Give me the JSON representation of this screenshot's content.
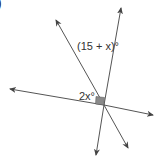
{
  "figure": {
    "corner_glyph": ")",
    "labels": {
      "top_angle": "(15 + x)°",
      "left_angle": "2x°"
    },
    "lines": [
      {
        "name": "line-steep",
        "from": [
          96,
          155
        ],
        "to": [
          121,
          8
        ]
      },
      {
        "name": "line-diagonal",
        "from": [
          128,
          148
        ],
        "to": [
          56,
          20
        ]
      },
      {
        "name": "line-horizontal",
        "from": [
          153,
          115
        ],
        "to": [
          10,
          89
        ]
      }
    ],
    "right_angle_marker": {
      "color": "#8a8a8a"
    },
    "colors": {
      "line": "#555555",
      "text": "#333333"
    }
  }
}
